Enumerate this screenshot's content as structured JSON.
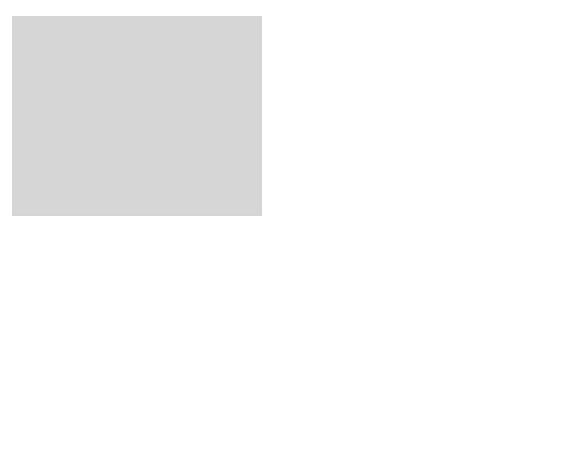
{
  "map": {
    "region_labels": {
      "canada": "C A N A D A",
      "montana": "MONTANA",
      "north_dakota": [
        "NORTH",
        "DAKOTA"
      ],
      "south_dakota": [
        "SOUTH",
        "DAKOTA"
      ],
      "minnesota": "MINNESOTA",
      "wyoming": "WYOMING",
      "nebraska": "NEBRASKA",
      "iowa": "IOWA",
      "colorado": "COLORADO",
      "kansas": "KANSAS",
      "missouri": "MISSOURI"
    },
    "territory_marker": "1",
    "colors": {
      "territory": "#4d4d4d",
      "land": "#d4d4d4",
      "land_dark": "#c6c6c6",
      "nebraska": "#f2f2f2",
      "border": "#555555",
      "river": "#8c8c8c",
      "inset_bg": "#f4f4f4"
    }
  },
  "inset": {
    "title": "NORTH AMERICA",
    "callout": "Crow",
    "labels": {
      "pacific": [
        "Pacific",
        "Ocean"
      ],
      "gulf": [
        "Gulf of",
        "Mexico"
      ],
      "atlantic": "Atlantic Ocean"
    }
  }
}
